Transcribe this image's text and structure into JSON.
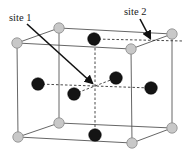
{
  "labels": {
    "site1": "site 1",
    "site2": "site 2"
  },
  "colors": {
    "corner_atom": "#c8c8c8",
    "face_atom": "#141414",
    "edge": "#555555"
  },
  "atoms": {
    "corner": [
      {
        "name": "top-left-front",
        "x": 17,
        "y": 43
      },
      {
        "name": "top-left-back",
        "x": 59,
        "y": 28
      },
      {
        "name": "top-right-front",
        "x": 131,
        "y": 49
      },
      {
        "name": "top-right-back",
        "x": 172,
        "y": 34
      },
      {
        "name": "bottom-left-front",
        "x": 18,
        "y": 137
      },
      {
        "name": "bottom-left-back",
        "x": 59,
        "y": 123
      },
      {
        "name": "bottom-right-front",
        "x": 132,
        "y": 143
      },
      {
        "name": "bottom-right-back",
        "x": 172,
        "y": 128
      }
    ],
    "face": [
      {
        "name": "top",
        "x": 94,
        "y": 39
      },
      {
        "name": "left",
        "x": 38,
        "y": 84
      },
      {
        "name": "front",
        "x": 74,
        "y": 94
      },
      {
        "name": "back",
        "x": 116,
        "y": 78
      },
      {
        "name": "right",
        "x": 151,
        "y": 88
      },
      {
        "name": "bottom",
        "x": 95,
        "y": 135
      }
    ]
  }
}
